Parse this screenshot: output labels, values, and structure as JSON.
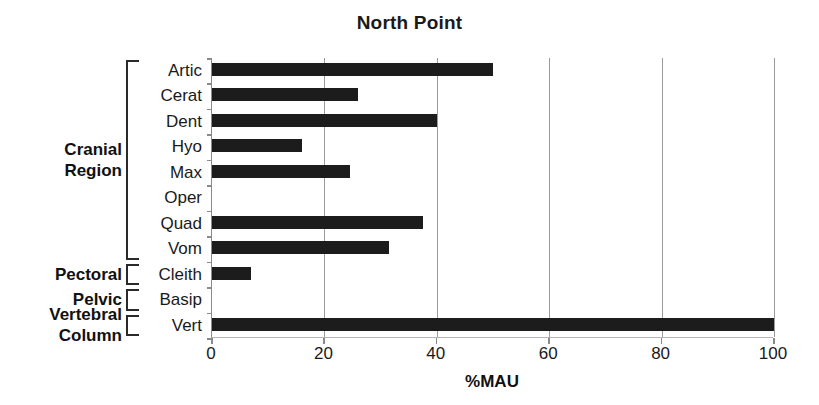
{
  "chart_data": {
    "type": "bar",
    "orientation": "horizontal",
    "title": "North Point",
    "xlabel": "%MAU",
    "ylabel": "",
    "xlim": [
      0,
      100
    ],
    "xticks": [
      0,
      20,
      40,
      60,
      80,
      100
    ],
    "xtick_labels": [
      "0",
      "20",
      "40",
      "60",
      "80",
      "100"
    ],
    "grid": "vertical",
    "legend": "none",
    "bar_color": "#1c1c1c",
    "categories": [
      "Artic",
      "Cerat",
      "Dent",
      "Hyo",
      "Max",
      "Oper",
      "Quad",
      "Vom",
      "Cleith",
      "Basip",
      "Vert"
    ],
    "values": [
      50,
      26,
      40,
      16,
      24.5,
      0,
      37.5,
      31.5,
      7,
      0,
      100
    ],
    "groups": [
      {
        "name": "Cranial Region",
        "name_lines": [
          "Cranial",
          "Region"
        ],
        "start_index": 0,
        "end_index": 7
      },
      {
        "name": "Pectoral",
        "name_lines": [
          "Pectoral"
        ],
        "start_index": 8,
        "end_index": 8
      },
      {
        "name": "Pelvic",
        "name_lines": [
          "Pelvic"
        ],
        "start_index": 9,
        "end_index": 9
      },
      {
        "name": "Vertebral Column",
        "name_lines": [
          "Vertebral",
          "Column"
        ],
        "start_index": 10,
        "end_index": 10
      }
    ]
  }
}
